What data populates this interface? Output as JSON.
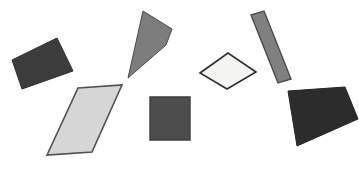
{
  "scene": {
    "title": "Geometric Shapes Figure",
    "width": 359,
    "height": 171,
    "background_color": "#ffffff",
    "shape_count": 7
  },
  "chart_data": {
    "type": "scatter",
    "subtitle": "",
    "xlabel": "",
    "ylabel": "",
    "grid": false,
    "legend": "none",
    "xlim": [
      0,
      359
    ],
    "ylim": [
      0,
      171
    ],
    "categories": [
      "dark-quadrilateral-left",
      "gray-kite-top",
      "light-parallelogram",
      "dark-square-center",
      "white-diamond",
      "gray-slanted-bar",
      "dark-quadrilateral-right"
    ],
    "values": [
      7,
      6,
      5,
      4,
      3,
      2,
      1
    ]
  },
  "shapes": [
    {
      "id": "dark-quadrilateral-left",
      "label": "Dark quadrilateral",
      "kind": "quadrilateral",
      "fill": "#3c3c3c",
      "stroke": "#2e2e2e",
      "stroke_width": 1,
      "points": "12,60 57,38 73,71 22,89"
    },
    {
      "id": "gray-kite-top",
      "label": "Gray kite",
      "kind": "quadrilateral",
      "fill": "#7d7d7d",
      "stroke": "#4a4a4a",
      "stroke_width": 1,
      "points": "143,11 172,29 166,45 128,78"
    },
    {
      "id": "light-parallelogram",
      "label": "Light gray parallelogram",
      "kind": "parallelogram",
      "fill": "#d6d6d6",
      "stroke": "#4f4f4f",
      "stroke_width": 1.6,
      "points": "78,88 122,85 92,152 47,155"
    },
    {
      "id": "dark-square-center",
      "label": "Dark square",
      "kind": "square",
      "fill": "#4d4d4d",
      "stroke": "#3c3c3c",
      "stroke_width": 1.4,
      "points": "150,97 190,97 190,140 150,140"
    },
    {
      "id": "white-diamond",
      "label": "White diamond",
      "kind": "rhombus",
      "fill": "#f4f4f2",
      "stroke": "#2f2f2f",
      "stroke_width": 1.6,
      "points": "200,73 228,53 256,72 227,89"
    },
    {
      "id": "gray-slanted-bar",
      "label": "Gray slanted bar",
      "kind": "rectangle",
      "fill": "#808080",
      "stroke": "#4a4a4a",
      "stroke_width": 1.4,
      "points": "251,15 264,11 291,79 278,83"
    },
    {
      "id": "dark-quadrilateral-right",
      "label": "Dark quadrilateral",
      "kind": "quadrilateral",
      "fill": "#2c2c2c",
      "stroke": "#232323",
      "stroke_width": 1,
      "points": "288,91 345,87 358,119 297,146"
    }
  ]
}
